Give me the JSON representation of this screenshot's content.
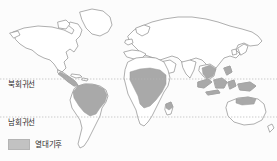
{
  "figure": {
    "kind": "world-climate-map",
    "background_color": "#fcfcfc"
  },
  "map": {
    "land_outline_color": "#8c8c8c",
    "land_fill_color": "#ffffff",
    "highlight_fill_color": "#a9a9a9",
    "highlight_outline_color": "#9a9a9a"
  },
  "latitude_lines": [
    {
      "id": "tropic-of-cancer",
      "label": "북회귀선",
      "line_color": "#b5b5b5",
      "style": "dotted",
      "y": 79
    },
    {
      "id": "tropic-of-capricorn",
      "label": "남회귀선",
      "line_color": "#b5b5b5",
      "style": "dotted",
      "y": 117
    }
  ],
  "legend": {
    "swatch_color": "#c2c2c2",
    "label": "열대기후"
  }
}
